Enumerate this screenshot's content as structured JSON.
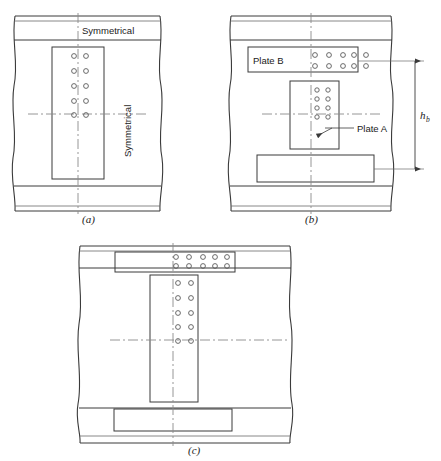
{
  "figure": {
    "background_color": "#ffffff",
    "line_color": "#3a3a3a",
    "thin_line_color": "#6b6b6b",
    "centerline_color": "#8a8a8a",
    "bolt_stroke": "#5a5a5a",
    "panels": [
      {
        "id": "a",
        "label": "(a)",
        "label_x": 88,
        "label_y": 219,
        "annotations": [
          {
            "name": "symmetrical-top",
            "text": "Symmetrical",
            "x": 82,
            "y": 31,
            "orientation": "horizontal"
          },
          {
            "name": "symmetrical-vertical",
            "text": "Symmetrical",
            "x": 131,
            "y": 155,
            "orientation": "vertical"
          }
        ],
        "bolt_groups": [
          {
            "name": "web-plate-bolts",
            "rows": 5,
            "cols": 2,
            "x0": 74,
            "y0": 56,
            "dx": 12,
            "dy": 16,
            "r": 2.4
          }
        ]
      },
      {
        "id": "b",
        "label": "(b)",
        "label_x": 311,
        "label_y": 219,
        "annotations": [
          {
            "name": "plate-b-label",
            "text": "Plate B",
            "x": 252,
            "y": 63,
            "orientation": "horizontal"
          },
          {
            "name": "plate-a-label",
            "text": "Plate A",
            "x": 357,
            "y": 131,
            "orientation": "horizontal"
          },
          {
            "name": "hb-dimension",
            "text": "h",
            "subscript": "b",
            "x": 420,
            "y": 118,
            "orientation": "horizontal"
          }
        ],
        "bolt_groups": [
          {
            "name": "plate-b-bolts",
            "rows": 2,
            "cols": 5,
            "x0": 315,
            "y0": 55,
            "dx": 14,
            "dy": 14,
            "r": 2.4
          },
          {
            "name": "plate-a-bolts",
            "rows": 4,
            "cols": 2,
            "x0": 317,
            "y0": 90,
            "dx": 11,
            "dy": 9,
            "r": 2.2
          }
        ]
      },
      {
        "id": "c",
        "label": "(c)",
        "label_x": 194,
        "label_y": 450,
        "annotations": [],
        "bolt_groups": [
          {
            "name": "flange-plate-bolts",
            "rows": 2,
            "cols": 5,
            "x0": 176,
            "y0": 258,
            "dx": 14,
            "dy": 10,
            "r": 2.4
          },
          {
            "name": "web-plate-bolts-c",
            "rows": 5,
            "cols": 2,
            "x0": 178,
            "y0": 283,
            "dx": 14,
            "dy": 17,
            "r": 2.4
          }
        ]
      }
    ]
  },
  "labels": {
    "symmetrical": "Symmetrical",
    "plate_a": "Plate A",
    "plate_b": "Plate B",
    "hb": "h",
    "hb_sub": "b",
    "panel_a": "(a)",
    "panel_b": "(b)",
    "panel_c": "(c)"
  }
}
